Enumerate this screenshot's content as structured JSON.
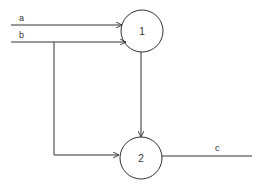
{
  "diagram": {
    "type": "flow-diagram",
    "colors": {
      "line": "#333333",
      "background": "#ffffff"
    },
    "nodes": [
      {
        "id": "1",
        "label": "1",
        "cx": 142,
        "cy": 31,
        "r": 21
      },
      {
        "id": "2",
        "label": "2",
        "cx": 141,
        "cy": 158,
        "r": 21
      }
    ],
    "edges": [
      {
        "id": "a",
        "label": "a",
        "from": "input",
        "to": "1"
      },
      {
        "id": "b",
        "label": "b",
        "from": "input",
        "to": "1"
      },
      {
        "id": "b-branch",
        "label": "",
        "from": "b",
        "to": "2"
      },
      {
        "id": "1-2",
        "label": "",
        "from": "1",
        "to": "2"
      },
      {
        "id": "c",
        "label": "c",
        "from": "2",
        "to": "output"
      }
    ]
  },
  "labels": {
    "a": "a",
    "b": "b",
    "c": "c",
    "node1": "1",
    "node2": "2"
  }
}
